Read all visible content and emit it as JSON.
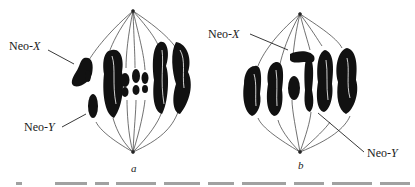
{
  "figure": {
    "panels": [
      {
        "id": "a",
        "letter": "a",
        "labels": {
          "neo_x": {
            "prefix": "Neo-",
            "var": "X"
          },
          "neo_y": {
            "prefix": "Neo-",
            "var": "Y"
          }
        }
      },
      {
        "id": "b",
        "letter": "b",
        "labels": {
          "neo_x": {
            "prefix": "Neo-",
            "var": "X"
          },
          "neo_y": {
            "prefix": "Neo-",
            "var": "Y"
          }
        }
      }
    ],
    "colors": {
      "chromosome": "#111111",
      "spindle": "#333333",
      "text": "#1a1a1a",
      "background": "#ffffff"
    }
  }
}
